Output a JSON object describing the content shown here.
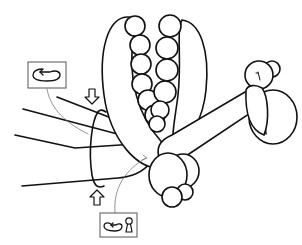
{
  "diagram": {
    "type": "balloon-twisting-instruction",
    "colors": {
      "line": "#111111",
      "connector": "#777777",
      "box_border": "#555555",
      "background": "#ffffff"
    },
    "elements": {
      "long_balloon": "long-balloon-loop",
      "bubble_chain": "bubble-chain",
      "head": "head-bubbles",
      "body": "body-bubbles",
      "leash_lines": "leash-lines",
      "twist_arrows": [
        "arrow-down",
        "arrow-up"
      ],
      "rotation_loop": "twist-rotation-loop"
    },
    "callouts": [
      {
        "id": "twist",
        "icons": [
          "rotate-counterclockwise-icon"
        ]
      },
      {
        "id": "twist-lock",
        "icons": [
          "rotate-counterclockwise-icon",
          "lock-keyhole-icon"
        ]
      }
    ]
  }
}
